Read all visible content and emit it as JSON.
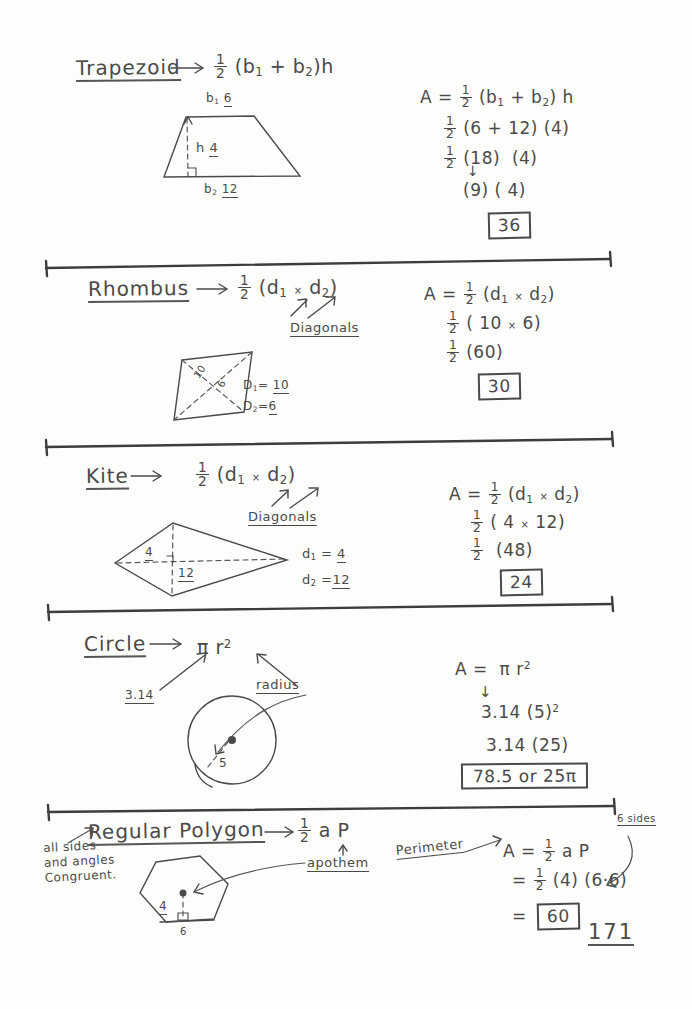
{
  "page": {
    "page_number": "171",
    "background_color": "#fdfdfb",
    "ink_color": "#4a4a4a"
  },
  "sections": [
    {
      "id": "trapezoid",
      "title": "Trapezoid",
      "arrow": "→",
      "formula": {
        "frac_num": "1",
        "frac_den": "2",
        "body_open": "(b",
        "sub1": "1",
        "plus": "+",
        "b2": "b",
        "sub2": "2",
        "body_close": ")h"
      },
      "figure": {
        "top_label": "b",
        "top_sub": "1",
        "top_value": "6",
        "height_label": "h",
        "height_value": "4",
        "bottom_label": "b",
        "bottom_sub": "2",
        "bottom_value": "12"
      },
      "work": {
        "line1": "A =",
        "line1_rest": "(b₁ + b₂) h",
        "line2": "(6 + 12) (4)",
        "line3": "(18)  (4)",
        "line4": "(9) ( 4)",
        "answer": "36"
      }
    },
    {
      "id": "rhombus",
      "title": "Rhombus",
      "arrow": "→",
      "callout": "Diagonals",
      "figure": {
        "diag1_label": "10",
        "diag2_label": "6",
        "d1_text": "D₁= 10",
        "d2_text": "D₂=6"
      },
      "work": {
        "line1": "A =",
        "line1_rest": "(d₁ × d₂)",
        "line2": "(10 × 6)",
        "line3": "(60)",
        "answer": "30"
      }
    },
    {
      "id": "kite",
      "title": "Kite",
      "arrow": "→",
      "callout": "Diagonals",
      "figure": {
        "vert_label": "4",
        "horiz_label": "12",
        "d1_text": "d₁ = 4",
        "d2_text": "d₂ = 12"
      },
      "work": {
        "line1": "A =",
        "line1_rest": "(d₁ × d₂)",
        "line2": "( 4 × 12)",
        "line3": "(48)",
        "answer": "24"
      }
    },
    {
      "id": "circle",
      "title": "Circle",
      "arrow": "→",
      "formula_text": "π r²",
      "pi_label": "3.14",
      "radius_label": "radius",
      "figure": {
        "radius_value": "5"
      },
      "work": {
        "line1": "A =  π r²",
        "down_arrow": "↓",
        "line2": "3.14 (5)²",
        "line3": "3.14 (25)",
        "answer": "78.5 or 25π"
      }
    },
    {
      "id": "regular-polygon",
      "title": "Regular Polygon",
      "arrow": "→",
      "note": "all sides and angles Congruent.",
      "apothem_label": "apothem",
      "perimeter_label": "Perimeter",
      "sides_label": "6 sides",
      "figure": {
        "apothem_value": "4",
        "side_value": "6"
      },
      "work": {
        "line1": "A =",
        "line1_rest": "a P",
        "line2_eq": "=",
        "line2": "(4) (6·6)",
        "line3_eq": "=",
        "answer": "60"
      }
    }
  ],
  "dividers": [
    {
      "y": 258
    },
    {
      "y": 435
    },
    {
      "y": 610
    },
    {
      "y": 805
    }
  ]
}
